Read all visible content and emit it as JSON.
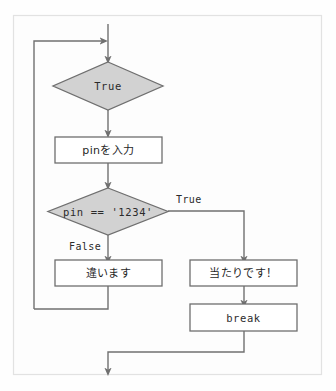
{
  "diagram": {
    "colors": {
      "decision_fill": "#d2d2d2",
      "process_fill": "#ffffff",
      "stroke": "#6f6f6f",
      "edge": "#707070",
      "frame": "#e2e2e2",
      "background": "#fefefe",
      "text": "#2b2b2b"
    },
    "nodes": {
      "loop_condition": {
        "label": "True",
        "shape": "diamond"
      },
      "input_pin": {
        "label": "pinを入力",
        "shape": "process"
      },
      "check_pin": {
        "label": "pin == '1234'",
        "shape": "diamond"
      },
      "wrong": {
        "label": "違います",
        "shape": "process"
      },
      "correct": {
        "label": "当たりです！",
        "shape": "process"
      },
      "break": {
        "label": "break",
        "shape": "process"
      }
    },
    "edge_labels": {
      "check_true": "True",
      "check_false": "False"
    }
  }
}
